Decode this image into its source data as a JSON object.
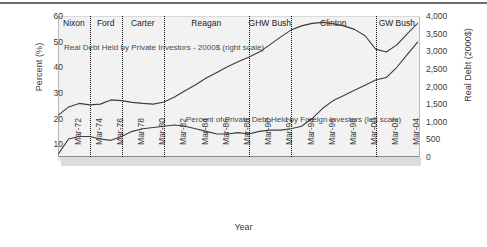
{
  "chart_data": {
    "type": "line",
    "title": "",
    "xlabel": "Year",
    "ylabel_left": "Percent (%)",
    "ylabel_right": "Real Debt (2000$)",
    "grid": false,
    "legend_position": "inline-annotation",
    "x_ticks": [
      "Mar-72",
      "Mar-74",
      "Mar-76",
      "Mar-78",
      "Mar-80",
      "Mar-82",
      "Mar-84",
      "Mar-86",
      "Mar-88",
      "Mar-90",
      "Mar-92",
      "Mar-94",
      "Mar-96",
      "Mar-98",
      "Mar-00",
      "Mar-02",
      "Mar-04"
    ],
    "y_ticks_left": [
      "60",
      "50",
      "40",
      "30",
      "20",
      "10"
    ],
    "y_ticks_right": [
      "4,000",
      "3,500",
      "3,000",
      "2,500",
      "2,000",
      "1,500",
      "1,000",
      "500",
      "0"
    ],
    "ylim_left": [
      5,
      60
    ],
    "ylim_right": [
      0,
      4000
    ],
    "annotations": [
      {
        "id": "debt",
        "text": "Real Debt Held by Private Investors - 2000$ (right scale)"
      },
      {
        "id": "foreign",
        "text": "Percent of Private Debt Held by Foreign Investors (left scale)"
      }
    ],
    "president_bands": [
      {
        "label": "Nixon",
        "start": "Mar-71",
        "end": "Mar-74"
      },
      {
        "label": "Ford",
        "start": "Mar-74",
        "end": "Mar-77"
      },
      {
        "label": "Carter",
        "start": "Mar-77",
        "end": "Mar-81"
      },
      {
        "label": "Reagan",
        "start": "Mar-81",
        "end": "Mar-89"
      },
      {
        "label": "GHW Bush",
        "start": "Mar-89",
        "end": "Mar-93"
      },
      {
        "label": "Clinton",
        "start": "Mar-93",
        "end": "Mar-01"
      },
      {
        "label": "GW Bush",
        "start": "Mar-01",
        "end": "Mar-05"
      }
    ],
    "series": [
      {
        "name": "Real Debt Held by Private Investors - 2000$ (right scale)",
        "axis": "right",
        "unit": "billions of 2000$",
        "x": [
          "Mar-71",
          "Mar-72",
          "Mar-73",
          "Mar-74",
          "Mar-75",
          "Mar-76",
          "Mar-77",
          "Mar-78",
          "Mar-79",
          "Mar-80",
          "Mar-81",
          "Mar-82",
          "Mar-83",
          "Mar-84",
          "Mar-85",
          "Mar-86",
          "Mar-87",
          "Mar-88",
          "Mar-89",
          "Mar-90",
          "Mar-91",
          "Mar-92",
          "Mar-93",
          "Mar-94",
          "Mar-95",
          "Mar-96",
          "Mar-97",
          "Mar-98",
          "Mar-99",
          "Mar-00",
          "Mar-01",
          "Mar-02",
          "Mar-03",
          "Mar-04",
          "Mar-05"
        ],
        "values": [
          1180,
          1420,
          1520,
          1480,
          1500,
          1620,
          1600,
          1550,
          1520,
          1500,
          1560,
          1700,
          1880,
          2050,
          2240,
          2400,
          2560,
          2700,
          2830,
          2980,
          3180,
          3400,
          3600,
          3720,
          3790,
          3820,
          3780,
          3720,
          3620,
          3440,
          3060,
          2980,
          3180,
          3500,
          3800
        ]
      },
      {
        "name": "Percent of Private Debt Held by Foreign Investors (left scale)",
        "axis": "left",
        "unit": "percent",
        "x": [
          "Mar-71",
          "Mar-72",
          "Mar-73",
          "Mar-74",
          "Mar-75",
          "Mar-76",
          "Mar-77",
          "Mar-78",
          "Mar-79",
          "Mar-80",
          "Mar-81",
          "Mar-82",
          "Mar-83",
          "Mar-84",
          "Mar-85",
          "Mar-86",
          "Mar-87",
          "Mar-88",
          "Mar-89",
          "Mar-90",
          "Mar-91",
          "Mar-92",
          "Mar-93",
          "Mar-94",
          "Mar-95",
          "Mar-96",
          "Mar-97",
          "Mar-98",
          "Mar-99",
          "Mar-00",
          "Mar-01",
          "Mar-02",
          "Mar-03",
          "Mar-04",
          "Mar-05"
        ],
        "values": [
          6,
          12,
          13,
          13,
          12,
          11.5,
          13,
          15,
          16,
          16.5,
          17,
          17.5,
          17,
          16,
          15,
          14,
          14,
          14.5,
          14,
          15,
          15.5,
          15.5,
          16,
          17,
          20,
          24,
          27,
          29,
          31,
          33,
          35,
          36,
          40,
          45,
          50
        ]
      }
    ]
  },
  "axes": {
    "left_title": "Percent (%)",
    "right_title": "Real Debt (2000$)",
    "bottom_title": "Year"
  }
}
